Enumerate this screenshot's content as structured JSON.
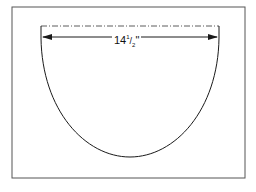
{
  "diagram": {
    "type": "semicircular-template",
    "dimension_label": "14½\"",
    "dimension_whole": "14",
    "dimension_num": "1",
    "dimension_den": "2",
    "dimension_unit": "\"",
    "colors": {
      "line": "#1a1a1a",
      "frame": "#555555",
      "background": "#ffffff"
    }
  }
}
